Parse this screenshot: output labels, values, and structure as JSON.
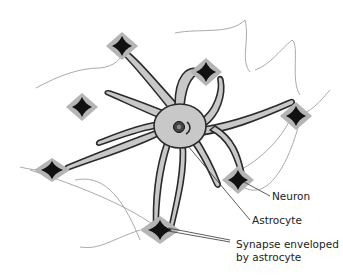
{
  "diagram": {
    "type": "biology-illustration",
    "colors": {
      "background": "#ffffff",
      "astrocyte_fill": "#c8c8c8",
      "outline": "#2a2a2a",
      "neuron_body": "#111111",
      "neuron_halo": "#b5b5b5",
      "faint_lines": "#9a9a9a"
    },
    "labels": [
      {
        "id": "neuron",
        "text": "Neuron"
      },
      {
        "id": "astrocyte",
        "text": "Astrocyte"
      },
      {
        "id": "synapse_line1",
        "text": "Synapse enveloped"
      },
      {
        "id": "synapse_line2",
        "text": "by astrocyte"
      }
    ]
  }
}
